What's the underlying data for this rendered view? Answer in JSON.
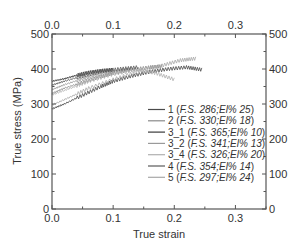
{
  "chart_data": {
    "type": "line",
    "title": "",
    "xlabel": "True strain",
    "ylabel": "True stress (MPa)",
    "xlim": [
      0.0,
      0.35
    ],
    "ylim": [
      0,
      500
    ],
    "xticks": [
      "0.0",
      "0.1",
      "0.2",
      "0.3"
    ],
    "xticks_top": [
      "0.0",
      "0.1",
      "0.2",
      "0.3"
    ],
    "yticks": [
      "0",
      "100",
      "200",
      "300",
      "400",
      "500"
    ],
    "yticks_right": [
      "0",
      "100",
      "200",
      "300",
      "400",
      "500"
    ],
    "grid": false,
    "legend_position": "lower right (inside)",
    "series": [
      {
        "name": "1",
        "label_num": "1 (",
        "label_fs": "F.S. 286;El% 25",
        "label_close": ")",
        "color": "#4a4a4a",
        "x": [
          0.0,
          0.02,
          0.05,
          0.08,
          0.1,
          0.13,
          0.16,
          0.19,
          0.22,
          0.245
        ],
        "y": [
          286,
          300,
          325,
          350,
          365,
          380,
          392,
          400,
          405,
          398
        ]
      },
      {
        "name": "2",
        "label_num": "2 (",
        "label_fs": "F.S. 330;El% 18",
        "label_close": ")",
        "color": "#8a8a8a",
        "x": [
          0.0,
          0.02,
          0.05,
          0.08,
          0.1,
          0.13,
          0.16,
          0.18
        ],
        "y": [
          330,
          345,
          362,
          378,
          388,
          398,
          405,
          408
        ]
      },
      {
        "name": "3_1",
        "label_num": "3_1 (",
        "label_fs": "F.S. 365;El% 10",
        "label_close": ")",
        "color": "#3a3a3a",
        "x": [
          0.0,
          0.02,
          0.04,
          0.06,
          0.08,
          0.1
        ],
        "y": [
          365,
          372,
          382,
          390,
          395,
          398
        ]
      },
      {
        "name": "3_2",
        "label_num": "3_2 (",
        "label_fs": "F.S. 341;El% 13",
        "label_close": ")",
        "color": "#9a9a9a",
        "x": [
          0.0,
          0.02,
          0.05,
          0.08,
          0.11,
          0.13
        ],
        "y": [
          341,
          355,
          372,
          385,
          395,
          400
        ]
      },
      {
        "name": "3_4",
        "label_num": "3_4 (",
        "label_fs": "F.S. 326;El% 20",
        "label_close": ")",
        "color": "#b0b0b0",
        "x": [
          0.0,
          0.03,
          0.06,
          0.1,
          0.14,
          0.17,
          0.2
        ],
        "y": [
          326,
          345,
          365,
          385,
          398,
          388,
          370
        ]
      },
      {
        "name": "4",
        "label_num": "4 (",
        "label_fs": "F.S. 354;El% 14",
        "label_close": ")",
        "color": "#5a5a5a",
        "x": [
          0.0,
          0.02,
          0.05,
          0.08,
          0.11,
          0.14
        ],
        "y": [
          354,
          365,
          380,
          392,
          400,
          405
        ]
      },
      {
        "name": "5",
        "label_num": "5 (",
        "label_fs": "F.S. 297;El% 24",
        "label_close": ")",
        "color": "#a8a8a8",
        "x": [
          0.0,
          0.03,
          0.06,
          0.1,
          0.14,
          0.18,
          0.21,
          0.235
        ],
        "y": [
          297,
          320,
          345,
          370,
          392,
          410,
          425,
          430
        ]
      }
    ]
  }
}
